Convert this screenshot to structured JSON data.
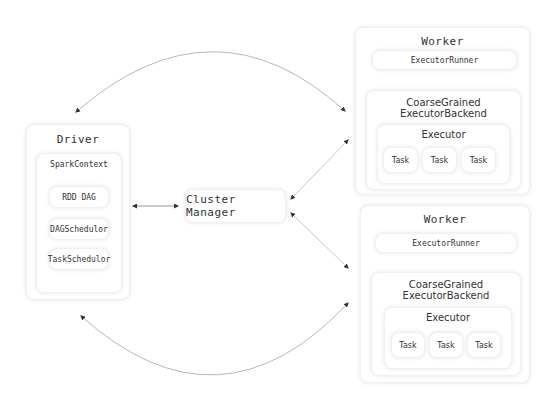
{
  "driver": {
    "title": "Driver",
    "spark_context": "SparkContext",
    "components": [
      "RDD DAG",
      "DAGSchedulor",
      "TaskSchedulor"
    ]
  },
  "cluster_manager": {
    "label": "Cluster Manager"
  },
  "workers": [
    {
      "title": "Worker",
      "runner": "ExecutorRunner",
      "backend_line1": "CoarseGrained",
      "backend_line2": "ExecutorBackend",
      "executor": "Executor",
      "tasks": [
        "Task",
        "Task",
        "Task"
      ]
    },
    {
      "title": "Worker",
      "runner": "ExecutorRunner",
      "backend_line1": "CoarseGrained",
      "backend_line2": "ExecutorBackend",
      "executor": "Executor",
      "tasks": [
        "Task",
        "Task",
        "Task"
      ]
    }
  ],
  "colors": {
    "line": "#b8b8b8",
    "arrow": "#333333",
    "border": "#f0f0f0"
  }
}
